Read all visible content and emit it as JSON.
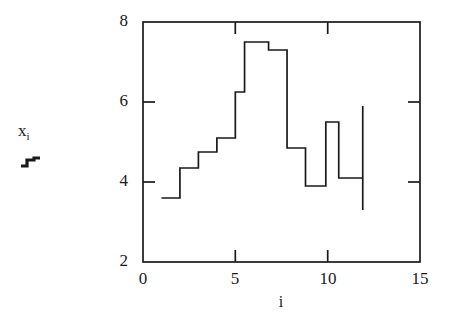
{
  "figure": {
    "background_color": "#ffffff",
    "line_color": "#1a1a1a"
  },
  "axis_labels": {
    "y_main": "x",
    "y_sub": "i",
    "y_glyph_name": "step-function-glyph",
    "x_title": "i"
  },
  "ticks": {
    "y": [
      "8",
      "6",
      "4",
      "2"
    ],
    "x": [
      "0",
      "5",
      "10",
      "15"
    ]
  },
  "chart_data": {
    "type": "line",
    "title": "",
    "xlabel": "i",
    "ylabel": "x_i",
    "xlim": [
      0,
      15
    ],
    "ylim": [
      2,
      8
    ],
    "xticks": [
      0,
      5,
      10,
      15
    ],
    "yticks": [
      2,
      4,
      6,
      8
    ],
    "grid": false,
    "legend": null,
    "drawstyle": "steps-post",
    "series": [
      {
        "name": "x_i",
        "x": [
          1,
          2,
          3,
          4,
          5,
          5.5,
          6.8,
          7.8,
          8.8,
          9.9,
          10.6,
          11.9
        ],
        "values": [
          3.6,
          4.35,
          4.75,
          5.1,
          6.25,
          7.5,
          7.3,
          4.85,
          3.9,
          5.5,
          4.1,
          5.9
        ],
        "final_drop_to": 3.3,
        "final_drop_at_x": 11.9
      }
    ]
  }
}
